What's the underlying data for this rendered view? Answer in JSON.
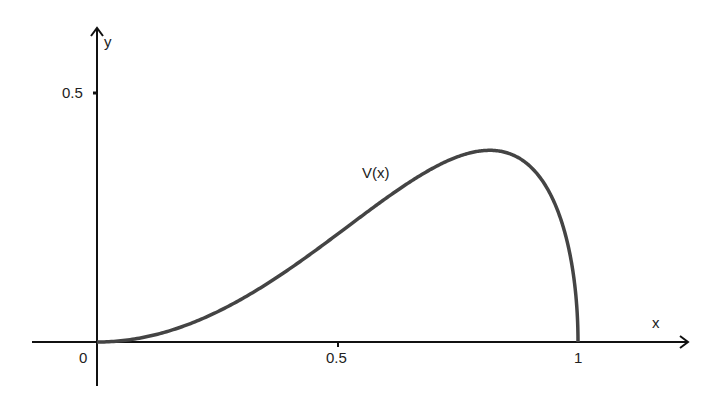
{
  "chart_data": {
    "type": "line",
    "title": "",
    "xlabel": "x",
    "ylabel": "y",
    "x_ticks": [
      "0",
      "0.5",
      "1"
    ],
    "y_ticks": [
      "0.5"
    ],
    "xlim": [
      0,
      1
    ],
    "ylim": [
      0,
      0.5
    ],
    "grid": false,
    "series": [
      {
        "name": "V(x)",
        "x": [
          0,
          0.1,
          0.2,
          0.3,
          0.4,
          0.5,
          0.6,
          0.7,
          0.8,
          0.816,
          0.9,
          0.95,
          1.0
        ],
        "values": [
          0,
          0.01,
          0.039,
          0.086,
          0.147,
          0.217,
          0.288,
          0.35,
          0.384,
          0.385,
          0.353,
          0.282,
          0
        ]
      }
    ],
    "annotations": [
      "V(x)"
    ]
  },
  "labels": {
    "origin": "0",
    "x_half": "0.5",
    "x_one": "1",
    "y_half": "0.5",
    "x_axis": "x",
    "y_axis": "y",
    "curve": "V(x)"
  }
}
